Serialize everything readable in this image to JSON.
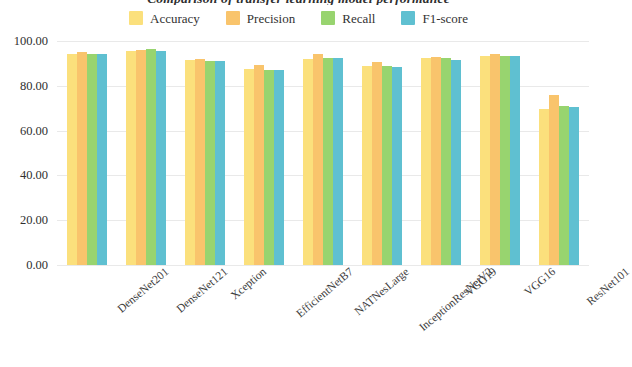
{
  "chart_data": {
    "type": "bar",
    "title": "Comparison of transfer learning model performance",
    "xlabel": "",
    "ylabel": "",
    "ylim": [
      0,
      100
    ],
    "ytick_labels": [
      "100.00",
      "80.00",
      "60.00",
      "40.00",
      "20.00",
      "0.00"
    ],
    "yticks": [
      100,
      80,
      60,
      40,
      20,
      0
    ],
    "grid": true,
    "legend_position": "top-center",
    "categories": [
      "DenseNet201",
      "DenseNet121",
      "Xception",
      "EfficientNetB7",
      "NATNesLarge",
      "InceptionResNetV2",
      "VGG19",
      "VGG16",
      "ResNet101"
    ],
    "series": [
      {
        "name": "Accuracy",
        "color": "#FBE07C",
        "values": [
          94.0,
          95.5,
          91.5,
          87.5,
          92.0,
          89.0,
          92.5,
          93.5,
          69.5
        ]
      },
      {
        "name": "Precision",
        "color": "#F9C46C",
        "values": [
          95.0,
          96.0,
          92.0,
          89.5,
          94.0,
          90.5,
          93.0,
          94.0,
          76.0
        ]
      },
      {
        "name": "Recall",
        "color": "#98D46F",
        "values": [
          94.0,
          96.5,
          91.0,
          87.0,
          92.5,
          89.0,
          92.5,
          93.5,
          71.0
        ]
      },
      {
        "name": "F1-score",
        "color": "#5FC0D1",
        "values": [
          94.0,
          95.5,
          91.0,
          87.0,
          92.5,
          88.5,
          91.5,
          93.5,
          70.5
        ]
      }
    ]
  }
}
